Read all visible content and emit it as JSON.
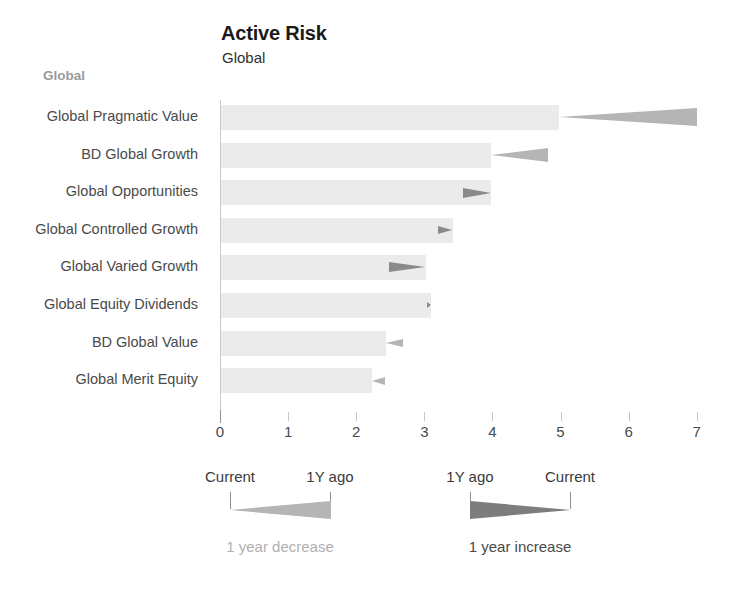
{
  "header": {
    "title": "Active Risk",
    "subtitle": "Global"
  },
  "group": {
    "label": "Global"
  },
  "legend": {
    "decrease": {
      "left_label": "Current",
      "right_label": "1Y ago",
      "caption": "1 year decrease",
      "color": "#b5b5b5",
      "caption_color": "#b0b0b0"
    },
    "increase": {
      "left_label": "1Y ago",
      "right_label": "Current",
      "caption": "1 year increase",
      "color": "#7d7d7d",
      "caption_color": "#4a4a4a"
    }
  },
  "colors": {
    "bar": "#ebebeb",
    "axis": "#c9c9c9",
    "decrease_arrow": "#b5b5b5",
    "increase_arrow": "#8a8a8a",
    "text": "#4a4a4a",
    "title": "#1a1a1a",
    "group_label": "#9a9a9a"
  },
  "chart_data": {
    "type": "bar",
    "title": "Active Risk",
    "subtitle": "Global",
    "xlabel": "",
    "ylabel": "",
    "xlim": [
      0,
      7
    ],
    "xticks": [
      0,
      1,
      2,
      3,
      4,
      5,
      6,
      7
    ],
    "xtick_labels": [
      "0",
      "1",
      "2",
      "3",
      "4",
      "5",
      "6",
      "7"
    ],
    "grid": false,
    "orientation": "horizontal",
    "legend_position": "bottom",
    "categories": [
      "Global Pragmatic Value",
      "BD Global Growth",
      "Global Opportunities",
      "Global Controlled Growth",
      "Global Varied Growth",
      "Global Equity Dividends",
      "BD Global Value",
      "Global Merit Equity"
    ],
    "series": [
      {
        "name": "Current",
        "values": [
          4.97,
          3.97,
          3.97,
          3.41,
          3.01,
          3.09,
          2.42,
          2.22
        ]
      },
      {
        "name": "1Y ago",
        "values": [
          7.0,
          4.82,
          3.55,
          3.19,
          2.47,
          3.02,
          2.67,
          2.42
        ]
      }
    ],
    "change_direction": [
      "decrease",
      "decrease",
      "increase",
      "increase",
      "increase",
      "increase",
      "decrease",
      "decrease"
    ],
    "rows": [
      {
        "label": "Global Pragmatic Value",
        "current": 4.97,
        "prior": 7.0,
        "direction": "decrease"
      },
      {
        "label": "BD Global Growth",
        "current": 3.97,
        "prior": 4.82,
        "direction": "decrease"
      },
      {
        "label": "Global Opportunities",
        "current": 3.97,
        "prior": 3.55,
        "direction": "increase"
      },
      {
        "label": "Global Controlled Growth",
        "current": 3.41,
        "prior": 3.19,
        "direction": "increase"
      },
      {
        "label": "Global Varied Growth",
        "current": 3.01,
        "prior": 2.47,
        "direction": "increase"
      },
      {
        "label": "Global Equity Dividends",
        "current": 3.09,
        "prior": 3.02,
        "direction": "increase"
      },
      {
        "label": "BD Global Value",
        "current": 2.42,
        "prior": 2.67,
        "direction": "decrease"
      },
      {
        "label": "Global Merit Equity",
        "current": 2.22,
        "prior": 2.42,
        "direction": "decrease"
      }
    ]
  }
}
